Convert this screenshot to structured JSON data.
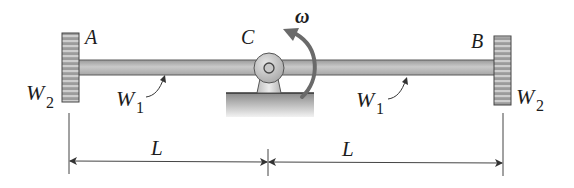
{
  "figure": {
    "type": "mechanics-diagram"
  },
  "labels": {
    "point_a": "A",
    "point_b": "B",
    "point_c": "C",
    "omega": "ω",
    "rod_weight_left": {
      "main": "W",
      "sub": "1"
    },
    "rod_weight_right": {
      "main": "W",
      "sub": "1"
    },
    "end_weight_left": {
      "main": "W",
      "sub": "2"
    },
    "end_weight_right": {
      "main": "W",
      "sub": "2"
    },
    "dim_left": "L",
    "dim_right": "L"
  },
  "colors": {
    "rod": "#b8b8b8",
    "rod_edge": "#5a5a5a",
    "weight_block": "#8e8e8e",
    "weight_stripe": "#c8c8c8",
    "pivot": "#c4c4c4",
    "base": "#9a9a9a",
    "arrow": "#6a6a6a",
    "line": "#333333",
    "text": "#1c1c1c"
  }
}
